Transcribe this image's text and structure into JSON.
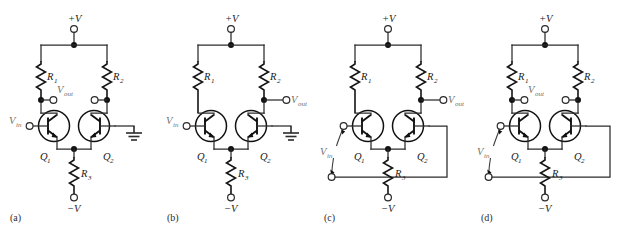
{
  "figure": {
    "panel_count": 4,
    "line_color": "#2b2b2b",
    "device_color": "#111111",
    "faint_label_color": "#6f6f6f",
    "background": "#ffffff"
  },
  "labels": {
    "supply_positive": "+V",
    "supply_negative": "−V",
    "r1": "R",
    "r1_sub": "1",
    "r2": "R",
    "r2_sub": "2",
    "r3": "R",
    "r3_sub": "3",
    "q1": "Q",
    "q1_sub": "1",
    "q2": "Q",
    "q2_sub": "2",
    "vin": "V",
    "vin_sub": "in",
    "vout": "V",
    "vout_sub": "out"
  },
  "panels": [
    {
      "id": "a",
      "caption": "(a)",
      "input_mode": "single-ended",
      "output_mode": "double-ended",
      "input_terminals": 1,
      "output_terminals": 2,
      "q2_base": "ground",
      "has_ground_symbol": true,
      "bottom_return_wire": false,
      "vin_label": "V",
      "vin_sub": "in",
      "vout_label": "V",
      "vout_sub": "out"
    },
    {
      "id": "b",
      "caption": "(b)",
      "input_mode": "single-ended",
      "output_mode": "single-ended",
      "input_terminals": 1,
      "output_terminals": 1,
      "q2_base": "ground",
      "has_ground_symbol": true,
      "bottom_return_wire": false,
      "vin_label": "V",
      "vin_sub": "in",
      "vout_label": "V",
      "vout_sub": "out"
    },
    {
      "id": "c",
      "caption": "(c)",
      "input_mode": "double-ended",
      "output_mode": "single-ended",
      "input_terminals": 2,
      "output_terminals": 1,
      "q2_base": "returned-to-lower-input",
      "has_ground_symbol": false,
      "bottom_return_wire": true,
      "vin_label": "V",
      "vin_sub": "in",
      "vout_label": "V",
      "vout_sub": "out"
    },
    {
      "id": "d",
      "caption": "(d)",
      "input_mode": "double-ended",
      "output_mode": "double-ended",
      "input_terminals": 2,
      "output_terminals": 2,
      "q2_base": "returned-to-lower-input",
      "has_ground_symbol": false,
      "bottom_return_wire": true,
      "vin_label": "V",
      "vin_sub": "in",
      "vout_label": "V",
      "vout_sub": "out"
    }
  ],
  "components": {
    "resistors": [
      "R1",
      "R2",
      "R3"
    ],
    "transistors": [
      "Q1",
      "Q2"
    ],
    "transistor_type": "npn",
    "supplies": [
      "+V",
      "−V"
    ]
  }
}
